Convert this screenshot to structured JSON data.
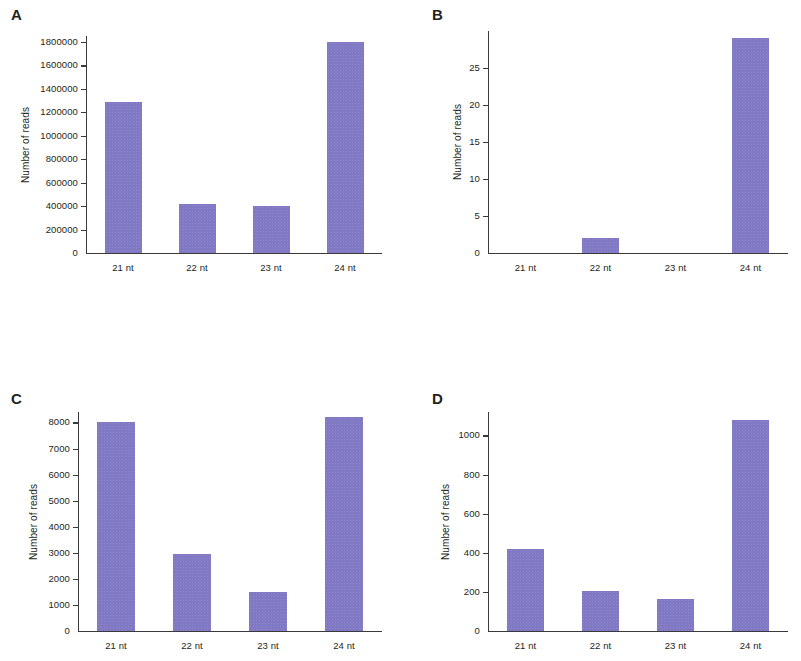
{
  "figure": {
    "bar_color": "#8179c4",
    "axis_color": "#3a3a3c",
    "background": "#ffffff",
    "y_axis_title": "Number of reads",
    "categories": [
      "21 nt",
      "22 nt",
      "23 nt",
      "24 nt"
    ]
  },
  "panels": {
    "A": {
      "letter": "A"
    },
    "B": {
      "letter": "B"
    },
    "C": {
      "letter": "C"
    },
    "D": {
      "letter": "D"
    }
  },
  "chart_data": [
    {
      "panel": "A",
      "type": "bar",
      "title": "A",
      "xlabel": "",
      "ylabel": "Number of reads",
      "categories": [
        "21 nt",
        "22 nt",
        "23 nt",
        "24 nt"
      ],
      "values": [
        1290000,
        415000,
        400000,
        1800000
      ],
      "ylim": [
        0,
        1850000
      ],
      "yticks": [
        0,
        200000,
        400000,
        600000,
        800000,
        1000000,
        1200000,
        1400000,
        1600000,
        1800000
      ],
      "ytick_labels": [
        "0",
        "200000",
        "400000",
        "600000",
        "800000",
        "1000000",
        "1200000",
        "1400000",
        "1600000",
        "1800000"
      ],
      "grid": false,
      "legend": false
    },
    {
      "panel": "B",
      "type": "bar",
      "title": "B",
      "xlabel": "",
      "ylabel": "Number of reads",
      "categories": [
        "21 nt",
        "22 nt",
        "23 nt",
        "24 nt"
      ],
      "values": [
        0,
        2,
        0,
        29
      ],
      "ylim": [
        0,
        30
      ],
      "yticks": [
        0,
        5,
        10,
        15,
        20,
        25
      ],
      "ytick_labels": [
        "0",
        "5",
        "10",
        "15",
        "20",
        "25"
      ],
      "grid": false,
      "legend": false
    },
    {
      "panel": "C",
      "type": "bar",
      "title": "C",
      "xlabel": "",
      "ylabel": "Number of reads",
      "categories": [
        "21 nt",
        "22 nt",
        "23 nt",
        "24 nt"
      ],
      "values": [
        8000,
        2950,
        1500,
        8200
      ],
      "ylim": [
        0,
        8400
      ],
      "yticks": [
        0,
        1000,
        2000,
        3000,
        4000,
        5000,
        6000,
        7000,
        8000
      ],
      "ytick_labels": [
        "0",
        "1000",
        "2000",
        "3000",
        "4000",
        "5000",
        "6000",
        "7000",
        "8000"
      ],
      "grid": false,
      "legend": false
    },
    {
      "panel": "D",
      "type": "bar",
      "title": "D",
      "xlabel": "",
      "ylabel": "Number of reads",
      "categories": [
        "21 nt",
        "22 nt",
        "23 nt",
        "24 nt"
      ],
      "values": [
        420,
        205,
        165,
        1080
      ],
      "ylim": [
        0,
        1120
      ],
      "yticks": [
        0,
        200,
        400,
        600,
        800,
        1000
      ],
      "ytick_labels": [
        "0",
        "200",
        "400",
        "600",
        "800",
        "1000"
      ],
      "grid": false,
      "legend": false
    }
  ]
}
